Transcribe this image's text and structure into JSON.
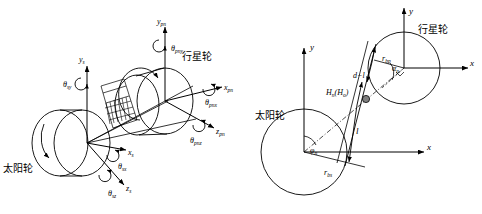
{
  "figure": {
    "type": "engineering-diagram"
  },
  "left_panel": {
    "name": "coordinate-frame-view",
    "labels": {
      "sun_gear": "太阳轮",
      "planet_gear": "行星轮"
    },
    "sun_axes": {
      "x": "x",
      "x_sub": "s",
      "y": "y",
      "y_sub": "s",
      "z": "z",
      "z_sub": "s"
    },
    "planet_axes": {
      "x": "x",
      "x_sub": "pn",
      "y": "y",
      "y_sub": "pn",
      "z": "z",
      "z_sub": "pn"
    },
    "sun_rotations": {
      "theta_x": "θ",
      "theta_x_sub": "sx",
      "theta_y": "θ",
      "theta_y_sub": "sy",
      "theta_z": "θ",
      "theta_z_sub": "sz"
    },
    "planet_rotations": {
      "theta_x": "θ",
      "theta_x_sub": "pnx",
      "theta_y": "θ",
      "theta_y_sub": "pny",
      "theta_z": "θ",
      "theta_z_sub": "pnz"
    }
  },
  "right_panel": {
    "name": "meshing-plane-view",
    "labels": {
      "sun_gear": "太阳轮",
      "planet_gear": "行星轮"
    },
    "sun_axes": {
      "x": "x",
      "y": "y"
    },
    "planet_axes": {
      "x": "x",
      "y": "y"
    },
    "dimensions": {
      "base_radius_sun": "r",
      "base_radius_sun_sub": "bs",
      "base_radius_planet": "r",
      "base_radius_planet_sub": "bp",
      "line_of_action": "l",
      "remaining_length": "d−l",
      "pressure_angle": "α",
      "pressure_angle_sub": "n",
      "position_angle": "φ",
      "position_angle_sub": "n",
      "contact_point": "H",
      "contact_point_sub": "n",
      "contact_point_alt": "(H",
      "contact_point_alt_sub": "o",
      "contact_point_close": ")"
    }
  },
  "colors": {
    "stroke": "#000000",
    "background": "#ffffff",
    "marker_fill": "#808080"
  }
}
